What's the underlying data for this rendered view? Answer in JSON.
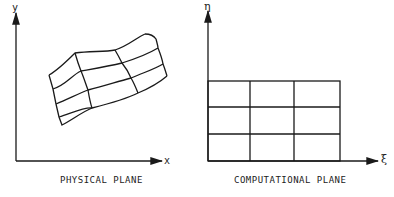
{
  "physical": {
    "x_label": "x",
    "y_label": "y",
    "caption": "PHYSICAL PLANE"
  },
  "computational": {
    "x_label": "ξ",
    "y_label": "η",
    "caption": "COMPUTATIONAL PLANE"
  },
  "colors": {
    "line": "#1a1a1a"
  }
}
